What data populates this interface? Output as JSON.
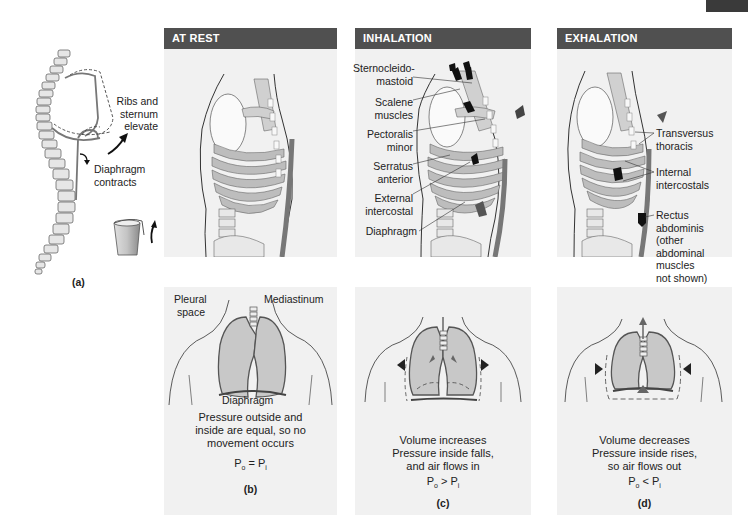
{
  "figure": {
    "corner_tab_color": "#3a3a3a",
    "header_color": "#505050",
    "panel_bg_color": "#f1f1f1",
    "lung_fill_color": "#c8c8c8",
    "arrow_color": "#1a1a1a"
  },
  "panel_a": {
    "letter": "(a)",
    "labels": {
      "ribs_sternum": [
        "Ribs and",
        "sternum",
        "elevate"
      ],
      "diaphragm": [
        "Diaphragm",
        "contracts"
      ]
    },
    "icons": [
      "spine-icon",
      "rib-cage-outline-icon",
      "bucket-handle-icon",
      "curved-arrow-icon"
    ]
  },
  "columns": [
    {
      "id": "at-rest",
      "header": "AT REST",
      "labels": [],
      "lung_labels": {
        "pleural_space": [
          "Pleural",
          "space"
        ],
        "mediastinum": "Mediastinum",
        "diaphragm": "Diaphragm"
      },
      "caption": [
        "Pressure outside and",
        "inside are equal, so no",
        "movement occurs"
      ],
      "equation": {
        "lhs": "P",
        "lhs_sub": "o",
        "op": " = ",
        "rhs": "P",
        "rhs_sub": "i"
      },
      "letter": "(b)"
    },
    {
      "id": "inhalation",
      "header": "INHALATION",
      "labels": [
        [
          "Sternocleido-",
          "mastoid"
        ],
        [
          "Scalene",
          "muscles"
        ],
        [
          "Pectoralis",
          "minor"
        ],
        [
          "Serratus",
          "anterior"
        ],
        [
          "External",
          "intercostal"
        ],
        [
          "Diaphragm"
        ]
      ],
      "caption": [
        "Volume increases",
        "Pressure inside falls,",
        "and air flows in"
      ],
      "equation": {
        "lhs": "P",
        "lhs_sub": "o",
        "op": " > ",
        "rhs": "P",
        "rhs_sub": "i"
      },
      "letter": "(c)"
    },
    {
      "id": "exhalation",
      "header": "EXHALATION",
      "labels": [
        [
          "Transversus",
          "thoracis"
        ],
        [
          "Internal",
          "intercostals"
        ],
        [
          "Rectus",
          "abdominis",
          "(other",
          "abdominal",
          "muscles",
          "not shown)"
        ]
      ],
      "caption": [
        "Volume decreases",
        "Pressure inside rises,",
        "so air flows out"
      ],
      "equation": {
        "lhs": "P",
        "lhs_sub": "o",
        "op": " < ",
        "rhs": "P",
        "rhs_sub": "i"
      },
      "letter": "(d)"
    }
  ]
}
